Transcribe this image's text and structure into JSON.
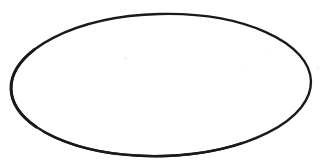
{
  "image": {
    "kind": "line-drawing",
    "description": "Hand-drawn ellipse outline on a plain white background",
    "width": 331,
    "height": 166,
    "background_color": "#ffffff",
    "text_content": "",
    "labels": []
  },
  "figure": {
    "shape_name": "ellipse",
    "stroke_color": "#1a1a1a",
    "fill_color": "#ffffff",
    "stroke_width_top": 2.0,
    "stroke_width_side": 3.0,
    "center_x": 161,
    "center_y": 85,
    "radius_x": 150,
    "radius_y": 71,
    "rotation_degrees": -1.5,
    "bbox_left": 11,
    "bbox_top": 13,
    "bbox_right": 312,
    "bbox_bottom": 156
  },
  "artifacts": {
    "note": "faint scanner speckles",
    "speckles": [
      {
        "x": 124,
        "y": 57,
        "size": 3,
        "color": "#f2f2f2"
      },
      {
        "x": 245,
        "y": 68,
        "size": 2,
        "color": "#f3f3f3"
      },
      {
        "x": 316,
        "y": 66,
        "size": 3,
        "color": "#f5f5f5"
      },
      {
        "x": 268,
        "y": 53,
        "size": 2,
        "color": "#f6f6f6"
      }
    ]
  }
}
